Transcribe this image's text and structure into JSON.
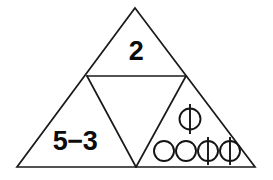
{
  "figure": {
    "type": "subdivided-triangle-diagram",
    "background_color": "#ffffff",
    "stroke_color": "#1a1a1a",
    "text_color": "#0c0c0c",
    "outer_triangle": {
      "apex": [
        135,
        8
      ],
      "bottom_left": [
        17,
        167
      ],
      "bottom_right": [
        255,
        167
      ],
      "left_midpoint": [
        87,
        76
      ],
      "right_midpoint": [
        186,
        76
      ],
      "bottom_midpoint": [
        136,
        167
      ]
    },
    "cells": {
      "top": {
        "name": "top-triangle",
        "text": "2"
      },
      "middle": {
        "name": "middle-inverted-triangle",
        "text": ""
      },
      "bottom_left": {
        "name": "bottom-left-triangle",
        "text": "5−3"
      },
      "bottom_right": {
        "name": "bottom-right-triangle",
        "upper_row": [
          "phi"
        ],
        "lower_row": [
          "circle",
          "circle",
          "phi",
          "phi"
        ]
      }
    },
    "symbols": {
      "circle": "○",
      "phi": "ϕ"
    }
  }
}
